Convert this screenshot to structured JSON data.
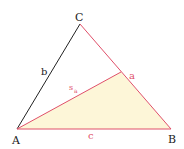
{
  "diagram": {
    "colors": {
      "background": "#ffffff",
      "fill": "#fdf6d8",
      "red": "#e0506a",
      "black": "#222222",
      "vertex_label": "#222222",
      "side_label": "#e0506a"
    },
    "vertices": {
      "A": {
        "label": "A",
        "x": 17,
        "y": 129
      },
      "B": {
        "label": "B",
        "x": 171,
        "y": 129
      },
      "C": {
        "label": "C",
        "x": 80,
        "y": 24
      },
      "M": {
        "label": "",
        "x": 121,
        "y": 72
      }
    },
    "sides": {
      "a": {
        "label": "a",
        "from": "B",
        "to": "C",
        "color": "red"
      },
      "b": {
        "label": "b",
        "from": "A",
        "to": "C",
        "color": "black"
      },
      "c": {
        "label": "c",
        "from": "A",
        "to": "B",
        "color": "red"
      }
    },
    "median": {
      "label": "s",
      "subscript": "a",
      "from": "A",
      "to": "M",
      "color": "red"
    },
    "shaded_region": "triangle A-B-M"
  }
}
